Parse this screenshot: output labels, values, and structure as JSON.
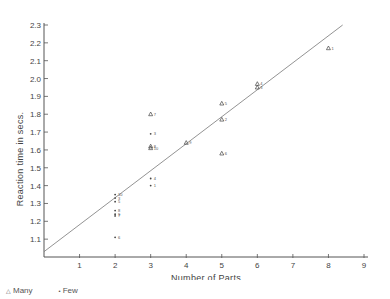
{
  "chart_data": {
    "type": "scatter",
    "title": "",
    "xlabel": "Number of Parts",
    "ylabel": "Reaction time in secs.",
    "xlim": [
      0,
      9
    ],
    "ylim": [
      1.0,
      2.3
    ],
    "x_ticks": [
      "1",
      "2",
      "3",
      "4",
      "5",
      "6",
      "7",
      "8",
      "9"
    ],
    "y_ticks": [
      "1.1",
      "1.2",
      "1.3",
      "1.4",
      "1.5",
      "1.6",
      "1.7",
      "1.8",
      "1.9",
      "2.0",
      "2.1",
      "2.2",
      "2.3"
    ],
    "grid": false,
    "legend_position": "bottom-left",
    "series": [
      {
        "name": "Many",
        "marker": "triangle",
        "points": [
          {
            "x": 3,
            "y": 1.8,
            "label": "7"
          },
          {
            "x": 3,
            "y": 1.62,
            "label": "8"
          },
          {
            "x": 3,
            "y": 1.61,
            "label": "10"
          },
          {
            "x": 4,
            "y": 1.64,
            "label": "9"
          },
          {
            "x": 5,
            "y": 1.86,
            "label": "5"
          },
          {
            "x": 5,
            "y": 1.77,
            "label": "2"
          },
          {
            "x": 5,
            "y": 1.58,
            "label": "6"
          },
          {
            "x": 6,
            "y": 1.97,
            "label": "4"
          },
          {
            "x": 6,
            "y": 1.95,
            "label": "3"
          },
          {
            "x": 8,
            "y": 2.17,
            "label": "1"
          }
        ]
      },
      {
        "name": "Few",
        "marker": "dot",
        "points": [
          {
            "x": 2,
            "y": 1.35,
            "label": "10"
          },
          {
            "x": 2,
            "y": 1.33,
            "label": "3"
          },
          {
            "x": 2,
            "y": 1.31,
            "label": "5"
          },
          {
            "x": 2,
            "y": 1.26,
            "label": "8"
          },
          {
            "x": 2,
            "y": 1.24,
            "label": "9"
          },
          {
            "x": 2,
            "y": 1.23,
            "label": "7"
          },
          {
            "x": 2,
            "y": 1.11,
            "label": "6"
          },
          {
            "x": 3,
            "y": 1.69,
            "label": "3"
          },
          {
            "x": 3,
            "y": 1.44,
            "label": "4"
          },
          {
            "x": 3,
            "y": 1.4,
            "label": "1"
          }
        ]
      }
    ],
    "fit_line": {
      "x0": 0,
      "y0": 1.03,
      "x1": 8.4,
      "y1": 2.3
    }
  },
  "legend": {
    "many_label": "Many",
    "few_label": "Few",
    "many_symbol": "△",
    "few_symbol": "•"
  }
}
